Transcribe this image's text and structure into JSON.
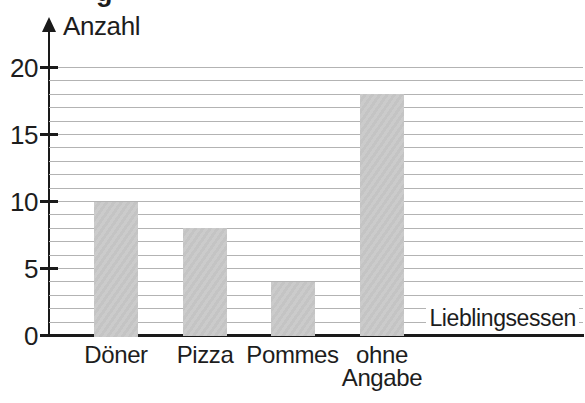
{
  "fragment": "g",
  "chart_data": {
    "type": "bar",
    "title": "",
    "categories": [
      "Döner",
      "Pizza",
      "Pommes",
      "ohne Angabe"
    ],
    "values": [
      10,
      8,
      4,
      18
    ],
    "xlabel": "Lieblingsessen",
    "ylabel": "Anzahl",
    "ylim": [
      0,
      20
    ],
    "yticks": [
      20,
      15,
      10,
      5,
      0
    ],
    "gridline_step": 1,
    "grid": true,
    "legend": false,
    "colors": {
      "bar_fill": "#c9c9c9",
      "gridline": "#b3b3b3",
      "axis": "#1a1a1a",
      "text": "#1d1d1d",
      "background": "#ffffff"
    }
  }
}
